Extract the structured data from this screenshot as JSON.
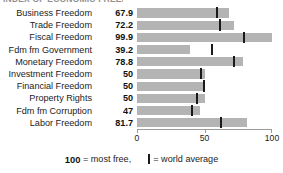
{
  "clipped_title": "INDEX OF ECONOMIC FREEDOM",
  "axis": {
    "ticks": [
      {
        "value": 0,
        "label": "0"
      },
      {
        "value": 50,
        "label": "50"
      },
      {
        "value": 100,
        "label": "100"
      }
    ],
    "min": 0,
    "max": 100
  },
  "legend": {
    "most_free_number": "100",
    "most_free_text": "= most free,",
    "marker_equals": "= world average",
    "marker_icon": "vertical-bar-icon"
  },
  "colors": {
    "bar_fill": "#b4b4b4",
    "marker": "#1a1a1a",
    "axis": "#9a9a9a",
    "text": "#1c1c1c",
    "background": "#ffffff"
  },
  "chart_data": {
    "type": "bar",
    "orientation": "horizontal",
    "title": "INDEX OF ECONOMIC FREEDOM",
    "xlabel": "",
    "ylabel": "",
    "xlim": [
      0,
      100
    ],
    "grid": false,
    "legend_position": "bottom",
    "categories": [
      "Business Freedom",
      "Trade Freedom",
      "Fiscal Freedom",
      "Fdm fm Government",
      "Monetary Freedom",
      "Investment Freedom",
      "Financial Freedom",
      "Property Rights",
      "Fdm fm Corruption",
      "Labor Freedom"
    ],
    "values": [
      67.9,
      72.2,
      99.9,
      39.2,
      78.8,
      50,
      50,
      50,
      47,
      81.7
    ],
    "value_labels": [
      "67.9",
      "72.2",
      "99.9",
      "39.2",
      "78.8",
      "50",
      "50",
      "50",
      "47",
      "81.7"
    ],
    "series": [
      {
        "name": "Country score",
        "values": [
          67.9,
          72.2,
          99.9,
          39.2,
          78.8,
          50,
          50,
          50,
          47,
          81.7
        ]
      },
      {
        "name": "World average",
        "marker": "vertical-bar",
        "values": [
          59.5,
          61.5,
          79.5,
          55.5,
          71.5,
          47.5,
          49.5,
          44.5,
          41,
          62
        ]
      }
    ],
    "rows": [
      {
        "label": "Business Freedom",
        "value": 67.9,
        "value_label": "67.9",
        "world_average": 59.5
      },
      {
        "label": "Trade Freedom",
        "value": 72.2,
        "value_label": "72.2",
        "world_average": 61.5
      },
      {
        "label": "Fiscal Freedom",
        "value": 99.9,
        "value_label": "99.9",
        "world_average": 79.5
      },
      {
        "label": "Fdm fm Government",
        "value": 39.2,
        "value_label": "39.2",
        "world_average": 55.5
      },
      {
        "label": "Monetary Freedom",
        "value": 78.8,
        "value_label": "78.8",
        "world_average": 71.5
      },
      {
        "label": "Investment Freedom",
        "value": 50,
        "value_label": "50",
        "world_average": 47.5
      },
      {
        "label": "Financial Freedom",
        "value": 50,
        "value_label": "50",
        "world_average": 49.5
      },
      {
        "label": "Property Rights",
        "value": 50,
        "value_label": "50",
        "world_average": 44.5
      },
      {
        "label": "Fdm fm Corruption",
        "value": 47,
        "value_label": "47",
        "world_average": 41
      },
      {
        "label": "Labor Freedom",
        "value": 81.7,
        "value_label": "81.7",
        "world_average": 62
      }
    ]
  }
}
